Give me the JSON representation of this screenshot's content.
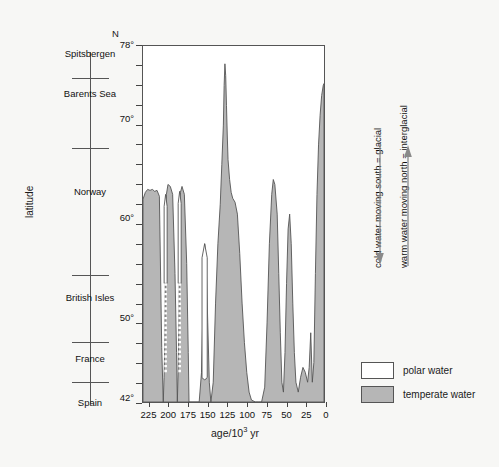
{
  "axes": {
    "y_axis_title": "latitude",
    "north_marker": "N",
    "y_tick_labels": [
      "78°",
      "70°",
      "60°",
      "50°",
      "42°"
    ],
    "y_tick_values": [
      78,
      70,
      60,
      50,
      42
    ],
    "y_minor_step_deg": 2,
    "x_axis_title_main": "age/10",
    "x_axis_title_sup": "3",
    "x_axis_title_unit": " yr",
    "x_tick_labels": [
      "225",
      "200",
      "175",
      "150",
      "125",
      "100",
      "75",
      "50",
      "25",
      "0"
    ],
    "x_tick_values": [
      225,
      200,
      175,
      150,
      125,
      100,
      75,
      50,
      25,
      0
    ]
  },
  "place_scale": {
    "labels": [
      "Spitsbergen",
      "Barents Sea",
      "Norway",
      "British Isles",
      "France",
      "Spain"
    ]
  },
  "annotations": [
    {
      "text": "cold water moving south = glacial",
      "arrow": "down-arrow"
    },
    {
      "text": "warm water moving north = interglacial",
      "arrow": "up-arrow"
    }
  ],
  "legend": {
    "items": [
      {
        "label": "polar water",
        "color": "#ffffff"
      },
      {
        "label": "temperate water",
        "color": "#b6b6b6"
      }
    ]
  },
  "colors": {
    "temperate_fill": "#b6b6b6",
    "polar_fill": "#ffffff",
    "outline": "#555555",
    "background": "#f7f7f5"
  },
  "chart_data": {
    "type": "area",
    "title": "",
    "subtitle": "",
    "xlabel": "age/10^3 yr",
    "ylabel": "latitude",
    "xlim": [
      232,
      0
    ],
    "ylim": [
      42,
      78
    ],
    "x_axis_reversed": true,
    "grid": false,
    "legend_position": "bottom-right",
    "series_name": "polar front latitude (boundary between polar and temperate water)",
    "boundary_points_age_lat": [
      [
        232,
        62.5
      ],
      [
        229,
        63.2
      ],
      [
        226,
        63.5
      ],
      [
        223,
        63.4
      ],
      [
        220,
        63.5
      ],
      [
        217,
        63.3
      ],
      [
        214,
        63.4
      ],
      [
        211,
        62.8
      ],
      [
        208,
        47.5
      ],
      [
        206,
        42.0
      ],
      [
        205,
        44.5
      ],
      [
        204,
        48.0
      ],
      [
        203,
        60.0
      ],
      [
        202,
        63.0
      ],
      [
        200,
        64.0
      ],
      [
        197,
        63.8
      ],
      [
        194,
        63.0
      ],
      [
        191,
        55.0
      ],
      [
        189,
        47.0
      ],
      [
        188,
        42.0
      ],
      [
        187,
        45.0
      ],
      [
        186,
        50.0
      ],
      [
        185,
        60.0
      ],
      [
        184,
        63.2
      ],
      [
        182,
        63.8
      ],
      [
        179,
        63.0
      ],
      [
        176,
        56.0
      ],
      [
        174,
        47.0
      ],
      [
        173,
        42.0
      ],
      [
        168,
        42.0
      ],
      [
        164,
        42.0
      ],
      [
        160,
        42.0
      ],
      [
        157,
        45.0
      ],
      [
        155,
        52.0
      ],
      [
        153,
        58.0
      ],
      [
        151,
        56.0
      ],
      [
        149,
        50.0
      ],
      [
        147,
        44.0
      ],
      [
        145,
        42.0
      ],
      [
        142,
        44.0
      ],
      [
        139,
        52.0
      ],
      [
        136,
        58.0
      ],
      [
        133,
        62.0
      ],
      [
        131,
        66.0
      ],
      [
        129,
        70.0
      ],
      [
        128,
        74.0
      ],
      [
        127,
        76.2
      ],
      [
        126,
        75.0
      ],
      [
        125,
        72.0
      ],
      [
        124,
        69.0
      ],
      [
        123,
        66.5
      ],
      [
        121,
        64.5
      ],
      [
        119,
        63.2
      ],
      [
        117,
        62.6
      ],
      [
        114,
        62.2
      ],
      [
        111,
        61.0
      ],
      [
        108,
        57.0
      ],
      [
        105,
        52.0
      ],
      [
        102,
        48.0
      ],
      [
        99,
        45.0
      ],
      [
        96,
        43.0
      ],
      [
        93,
        42.2
      ],
      [
        88,
        42.0
      ],
      [
        84,
        42.0
      ],
      [
        80,
        42.0
      ],
      [
        76,
        43.5
      ],
      [
        73,
        50.0
      ],
      [
        70,
        58.0
      ],
      [
        67,
        63.0
      ],
      [
        65,
        64.5
      ],
      [
        63,
        64.0
      ],
      [
        60,
        61.0
      ],
      [
        58,
        55.0
      ],
      [
        56,
        49.0
      ],
      [
        54,
        44.0
      ],
      [
        52,
        43.0
      ],
      [
        50,
        47.0
      ],
      [
        48,
        54.0
      ],
      [
        46,
        59.5
      ],
      [
        44,
        61.0
      ],
      [
        42,
        58.0
      ],
      [
        40,
        52.0
      ],
      [
        38,
        47.0
      ],
      [
        36,
        44.0
      ],
      [
        33,
        43.0
      ],
      [
        30,
        44.5
      ],
      [
        27,
        45.5
      ],
      [
        24,
        45.0
      ],
      [
        21,
        44.0
      ],
      [
        19,
        45.5
      ],
      [
        17,
        49.0
      ],
      [
        15,
        44.0
      ],
      [
        13,
        46.0
      ],
      [
        11,
        55.0
      ],
      [
        9,
        63.0
      ],
      [
        7,
        68.0
      ],
      [
        5,
        71.0
      ],
      [
        3,
        73.0
      ],
      [
        1,
        74.0
      ],
      [
        0,
        74.2
      ]
    ],
    "polar_incursions": [
      {
        "age": 203,
        "top_lat": 63.0,
        "solid_to_lat": 54.0,
        "dotted_to_lat": 45.0
      },
      {
        "age": 185,
        "top_lat": 63.3,
        "solid_to_lat": 54.0,
        "dotted_to_lat": 45.0
      },
      {
        "age": 153,
        "top_lat": 58.0,
        "bottom_lat": 44.0,
        "style": "solid-narrow"
      }
    ]
  }
}
